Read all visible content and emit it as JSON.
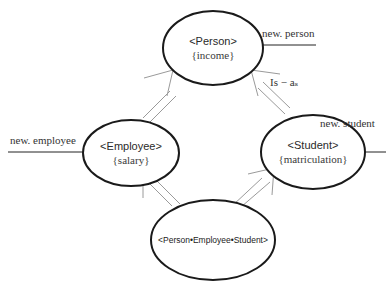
{
  "diagram": {
    "nodes": [
      {
        "id": "person",
        "class_label": "<Person>",
        "attribute": "{income}"
      },
      {
        "id": "employee",
        "class_label": "<Employee>",
        "attribute": "{salary}"
      },
      {
        "id": "student",
        "class_label": "<Student>",
        "attribute": "{matriculation}"
      },
      {
        "id": "combined",
        "class_label": "<Person•Employee•Student>"
      }
    ],
    "constructors": {
      "person": "new. person",
      "employee": "new. employee",
      "student": "new. student"
    },
    "relation_label": "Is − aₛ",
    "edges": [
      {
        "from": "employee",
        "to": "person",
        "type": "is-a"
      },
      {
        "from": "student",
        "to": "person",
        "type": "is-a"
      },
      {
        "from": "combined",
        "to": "employee",
        "type": "is-a"
      },
      {
        "from": "combined",
        "to": "student",
        "type": "is-a"
      }
    ],
    "colors": {
      "stroke": "#1a1a1a",
      "arrow": "#9a9a9a",
      "text": "#333333"
    }
  }
}
